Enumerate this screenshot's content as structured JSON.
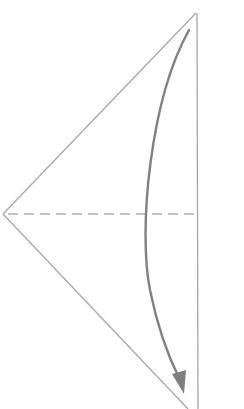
{
  "diagram": {
    "type": "origami-fold-step",
    "colors": {
      "background": "#ffffff",
      "edge": "#a8a8a8",
      "fold_line": "#b0b0b0",
      "arrow": "#808080"
    },
    "shape": {
      "top_apex": [
        196,
        13
      ],
      "left_vertex": [
        3,
        214
      ],
      "bottom_apex": [
        198,
        412
      ],
      "right_edge_x": 197
    },
    "fold_line": {
      "style": "dashed",
      "kind": "valley-fold",
      "y": 214,
      "x_start": 8,
      "x_end": 196
    },
    "arrow": {
      "start": [
        189,
        30
      ],
      "end": [
        184,
        392
      ],
      "direction": "down",
      "curve": "bulging-left"
    }
  }
}
